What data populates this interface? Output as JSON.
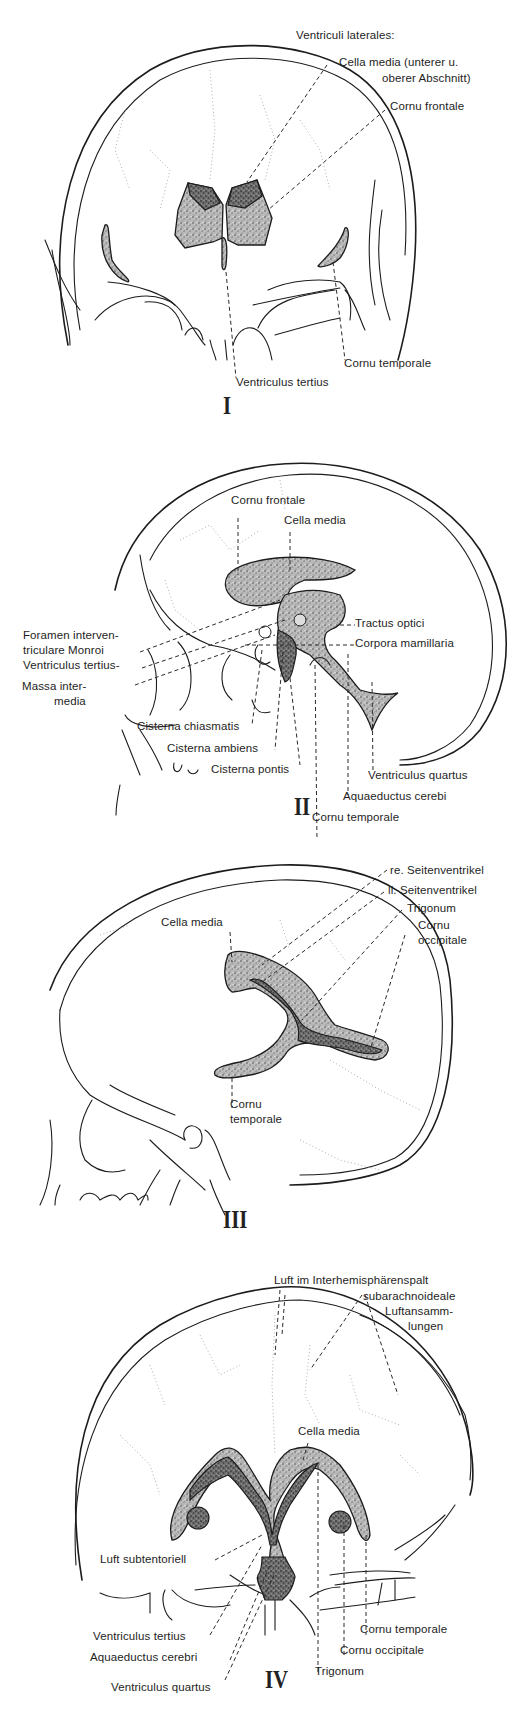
{
  "figure": {
    "panels": [
      {
        "id": "I",
        "numeral": "I",
        "view": "anterior (frontal) projection",
        "labels": {
          "header": "Ventriculi laterales:",
          "cella_media_1": "Cella media (unterer u.",
          "cella_media_2": "oberer Abschnitt)",
          "cornu_frontale": "Cornu frontale",
          "cornu_temporale": "Cornu temporale",
          "ventriculus_tertius": "Ventriculus tertius"
        }
      },
      {
        "id": "II",
        "numeral": "II",
        "view": "lateral projection (hanging head)",
        "labels": {
          "cornu_frontale": "Cornu frontale",
          "cella_media": "Cella media",
          "foramen_1": "Foramen interven-",
          "foramen_2": "triculare Monroi",
          "ventriculus_tertius": "Ventriculus tertius-",
          "massa_1": "Massa inter-",
          "massa_2": "media",
          "tractus_optici": "Tractus optici",
          "corpora_mamillaria": "Corpora mamillaria",
          "cisterna_chiasmatis": "Cisterna chiasmatis",
          "cisterna_ambiens": "Cisterna ambiens",
          "cisterna_pontis": "Cisterna pontis",
          "ventriculus_quartus": "Ventriculus quartus",
          "aquaeductus": "Aquaeductus cerebi",
          "cornu_temporale": "Cornu temporale"
        }
      },
      {
        "id": "III",
        "numeral": "III",
        "view": "lateral projection",
        "labels": {
          "re_seitenventrikel": "re. Seitenventrikel",
          "li_seitenventrikel": "li. Seitenventrikel",
          "trigonum": "Trigonum",
          "cornu_occipitale_1": "Cornu",
          "cornu_occipitale_2": "occipitale",
          "cella_media": "Cella media",
          "cornu_temporale_1": "Cornu",
          "cornu_temporale_2": "temporale"
        }
      },
      {
        "id": "IV",
        "numeral": "IV",
        "view": "posterior (occipital) projection",
        "labels": {
          "luft_interhemi": "Luft im Interhemisphärenspalt",
          "subarach_1": "subarachnoideale",
          "subarach_2": "Luftansamm-",
          "subarach_3": "lungen",
          "cella_media": "Cella media",
          "luft_subtentoriell": "Luft subtentoriell",
          "ventriculus_tertius": "Ventriculus tertius",
          "aquaeductus": "Aquaeductus cerebri",
          "ventriculus_quartus": "Ventriculus quartus",
          "cornu_temporale": "Cornu temporale",
          "cornu_occipitale": "Cornu occipitale",
          "trigonum": "Trigonum"
        }
      }
    ]
  }
}
